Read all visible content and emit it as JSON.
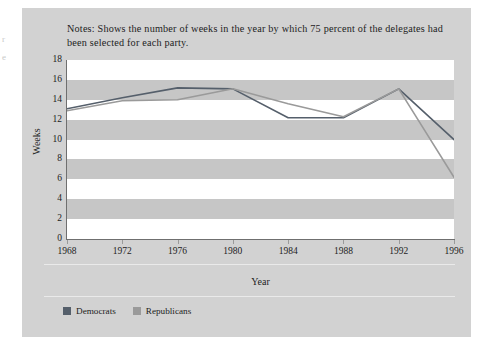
{
  "ghost_text": {
    "line1": "r",
    "line2": "e"
  },
  "notes": "Notes: Shows the number of weeks in the year by which 75 percent of the delegates had been selected for each party.",
  "legend": {
    "items": [
      {
        "label": "Democrats",
        "color": "#555f6b"
      },
      {
        "label": "Republicans",
        "color": "#9a9a9a"
      }
    ]
  },
  "colors": {
    "figure_background": "#d2d2d2",
    "band_gray": "#c6c6c6",
    "band_white": "#ffffff",
    "axis": "#6f6f6f",
    "text": "#1d1d1d",
    "democrats": "#555f6b",
    "republicans": "#9a9a9a"
  },
  "chart_data": {
    "type": "line",
    "title": "",
    "xlabel": "Year",
    "ylabel": "Weeks",
    "categories": [
      1968,
      1972,
      1976,
      1980,
      1984,
      1988,
      1992,
      1996
    ],
    "x": [
      1968,
      1972,
      1976,
      1980,
      1984,
      1988,
      1992,
      1996
    ],
    "xlim": [
      1968,
      1996
    ],
    "ylim": [
      0,
      18
    ],
    "ytick_labels": [
      "0",
      "2",
      "4",
      "6",
      "8",
      "10",
      "12",
      "14",
      "16",
      "18"
    ],
    "yticks": [
      0,
      2,
      4,
      6,
      8,
      10,
      12,
      14,
      16,
      18
    ],
    "xtick_labels": [
      "1968",
      "1972",
      "1976",
      "1980",
      "1984",
      "1988",
      "1992",
      "1996"
    ],
    "grid": false,
    "banded_background": true,
    "legend_position": "bottom-left",
    "series": [
      {
        "name": "Democrats",
        "color": "#555f6b",
        "values": [
          13.1,
          14.2,
          15.2,
          15.1,
          12.2,
          12.2,
          15.1,
          10.0
        ]
      },
      {
        "name": "Republicans",
        "color": "#9a9a9a",
        "values": [
          12.9,
          13.9,
          14.0,
          15.1,
          13.6,
          12.3,
          15.1,
          6.2
        ]
      }
    ]
  }
}
